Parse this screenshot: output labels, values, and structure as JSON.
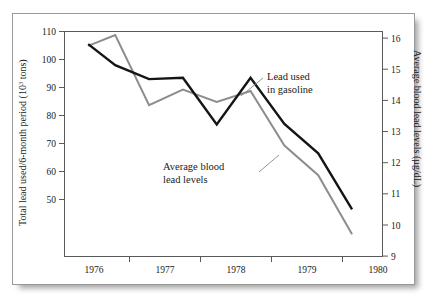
{
  "figure": {
    "background_color": "#ffffff",
    "frame_color": "#9a9a9a"
  },
  "chart_data": {
    "type": "line",
    "title": "",
    "subtitle": "",
    "xlabel": "",
    "ylabel": "Total lead used/6-month period (10³ tons)",
    "y2label": "Average blood lead levels (µg/dL)",
    "grid": false,
    "legend_position": "inline-annotations",
    "xlim": [
      1975.5,
      1980.2
    ],
    "xticks": [
      1976,
      1977,
      1978,
      1979,
      1980
    ],
    "xticklabels": [
      "1976",
      "1977",
      "1978",
      "1979",
      "1980"
    ],
    "minor_xticks": [
      1976.5,
      1977.5,
      1978.5,
      1979.5
    ],
    "ylim": [
      44,
      110
    ],
    "yticks": [
      50,
      60,
      70,
      80,
      90,
      100,
      110
    ],
    "yticklabels": [
      "50",
      "60",
      "70",
      "80",
      "90",
      "100",
      "110"
    ],
    "y2lim": [
      9,
      16.22
    ],
    "y2ticks": [
      9,
      10,
      11,
      12,
      13,
      14,
      15,
      16
    ],
    "y2ticklabels": [
      "9",
      "10",
      "11",
      "12",
      "13",
      "14",
      "15",
      "16"
    ],
    "series": [
      {
        "name": "Lead used in gasoline",
        "axis": "left",
        "color": "#151515",
        "x": [
          1975.85,
          1976.25,
          1976.75,
          1977.25,
          1977.75,
          1978.25,
          1978.75,
          1979.25,
          1979.75
        ],
        "values": [
          105.5,
          98.0,
          93.0,
          93.5,
          76.8,
          93.5,
          77.0,
          66.5,
          46.5
        ]
      },
      {
        "name": "Average blood lead levels",
        "axis": "right",
        "color": "#8d8d8d",
        "x": [
          1975.85,
          1976.25,
          1976.75,
          1977.25,
          1977.75,
          1978.25,
          1978.75,
          1979.25,
          1979.75
        ],
        "values": [
          15.75,
          16.1,
          13.85,
          14.35,
          13.95,
          14.3,
          12.55,
          11.6,
          9.7
        ]
      }
    ],
    "annotations": [
      {
        "id": "lead-used-annotation",
        "text_line1": "Lead used",
        "text_line2": "in gasoline",
        "points_to_series": "Lead used in gasoline"
      },
      {
        "id": "blood-lead-annotation",
        "text_line1": "Average blood",
        "text_line2": "lead levels",
        "points_to_series": "Average blood lead levels"
      }
    ]
  },
  "axes": {
    "left_title_parts": {
      "pre": "Total lead used/6-month period (10",
      "sup": "3",
      "post": " tons)"
    },
    "right_title": "Average blood lead levels (µg/dL)"
  }
}
